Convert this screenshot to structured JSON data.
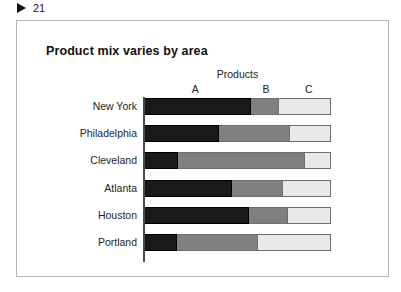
{
  "slide_marker": {
    "icon": "play-triangle-icon",
    "number": "21"
  },
  "chart_data": {
    "type": "bar",
    "orientation": "horizontal",
    "stacked": true,
    "normalized": true,
    "title": "Product mix varies by area",
    "group_label": "Products",
    "xlabel": "",
    "ylabel": "",
    "grid": false,
    "legend_position": "top-inline",
    "axis_note": "each bar totals 100%; segment labels A, B, C placed above first row",
    "categories": [
      "New York",
      "Philadelphia",
      "Cleveland",
      "Atlanta",
      "Houston",
      "Portland"
    ],
    "series": [
      {
        "name": "A",
        "color": "#1a1a1a",
        "values": [
          57,
          40,
          18,
          47,
          56,
          17
        ]
      },
      {
        "name": "B",
        "color": "#808080",
        "values": [
          15,
          38,
          68,
          27,
          21,
          44
        ]
      },
      {
        "name": "C",
        "color": "#e8e8e8",
        "values": [
          28,
          22,
          14,
          26,
          23,
          39
        ]
      }
    ],
    "column_header_positions_pct": [
      27,
      65,
      88
    ]
  },
  "colors": {
    "frame_border": "#b8b8b8",
    "axis": "#4a4a4a",
    "segment_a": "#1a1a1a",
    "segment_b": "#808080",
    "segment_c": "#e8e8e8",
    "text": "#1f1f1f"
  }
}
